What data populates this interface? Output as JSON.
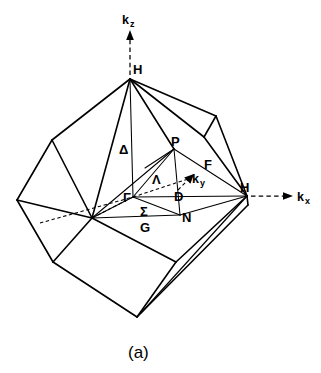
{
  "figure": {
    "caption": "(a)",
    "axes": [
      {
        "id": "kz",
        "base": "k",
        "subscript": "z",
        "direction": "up"
      },
      {
        "id": "kx",
        "base": "k",
        "subscript": "x",
        "direction": "right"
      },
      {
        "id": "ky",
        "base": "k",
        "subscript": "y",
        "direction": "up-right"
      }
    ],
    "symmetry_points": [
      {
        "id": "H-top",
        "label": "H",
        "x": 130,
        "y": 79
      },
      {
        "id": "H-right",
        "label": "H",
        "x": 247,
        "y": 196
      },
      {
        "id": "P",
        "label": "P",
        "x": 174,
        "y": 149
      },
      {
        "id": "Gamma",
        "label": "Γ",
        "x": 133,
        "y": 197
      },
      {
        "id": "N",
        "label": "N",
        "x": 180,
        "y": 215
      },
      {
        "id": "G",
        "label": "G",
        "x": 144,
        "y": 225
      }
    ],
    "symmetry_lines": [
      {
        "id": "Delta",
        "label": "Δ",
        "x": 125,
        "y": 150,
        "from": "Gamma",
        "to": "H-top"
      },
      {
        "id": "Lambda",
        "label": "Λ",
        "x": 158,
        "y": 180,
        "from": "Gamma",
        "to": "P"
      },
      {
        "id": "Sigma",
        "label": "Σ",
        "x": 144,
        "y": 211,
        "from": "Gamma",
        "to": "N"
      },
      {
        "id": "D",
        "label": "D",
        "x": 178,
        "y": 196,
        "from": "P",
        "to": "N"
      },
      {
        "id": "F",
        "label": "F",
        "x": 208,
        "y": 164,
        "from": "P",
        "to": "H-right"
      }
    ],
    "colors": {
      "ink": "#000000",
      "background": "#ffffff"
    }
  }
}
